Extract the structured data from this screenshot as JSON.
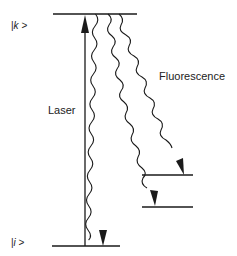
{
  "diagram": {
    "levels": [
      {
        "id": "k",
        "label_prefix": "|",
        "label_var": "k",
        "label_suffix": " >",
        "y": 14
      },
      {
        "id": "i",
        "label_prefix": "|",
        "label_var": "i",
        "label_suffix": " >",
        "y": 246
      },
      {
        "id": "intermediate-1",
        "y": 175
      },
      {
        "id": "intermediate-2",
        "y": 207
      }
    ],
    "labels": {
      "laser": "Laser",
      "fluorescence": "Fluorescence"
    },
    "transitions": [
      {
        "type": "laser-absorption",
        "from": "i",
        "to": "k",
        "style": "straight-arrow"
      },
      {
        "type": "fluorescence",
        "from": "k",
        "to": "i",
        "style": "wavy-arrow"
      },
      {
        "type": "fluorescence",
        "from": "k",
        "to": "intermediate-1",
        "style": "wavy-arrow"
      },
      {
        "type": "fluorescence",
        "from": "k",
        "to": "intermediate-1",
        "style": "wavy-arrow",
        "continues_to": "intermediate-2"
      }
    ],
    "colors": {
      "line": "#1a1a1a",
      "background": "#ffffff"
    }
  }
}
